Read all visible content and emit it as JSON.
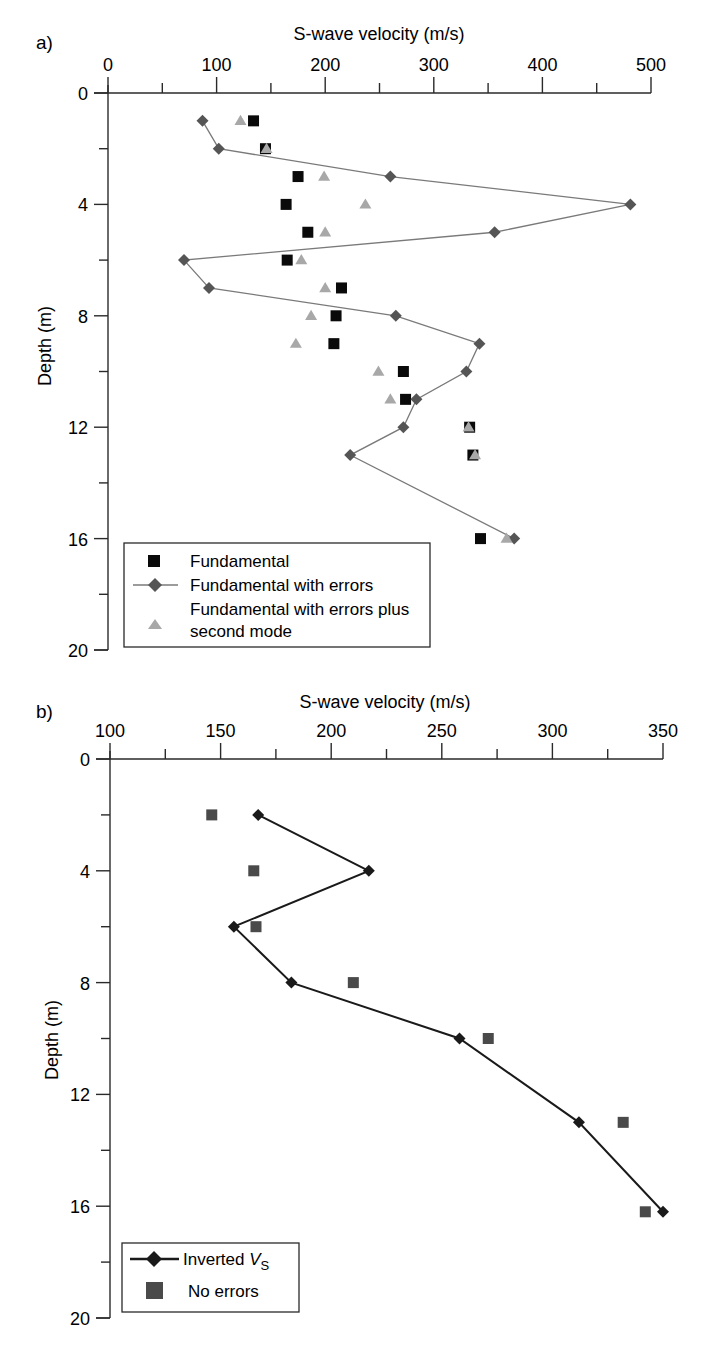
{
  "figure": {
    "panels": [
      {
        "id": "a",
        "label": "a)"
      },
      {
        "id": "b",
        "label": "b)"
      }
    ]
  },
  "colors": {
    "axis": "#2a2a2a",
    "fundamental_square": "#0a0a0a",
    "errors_diamond": "#555555",
    "errors_line": "#7a7a7a",
    "second_mode_triangle": "#a8a8a8",
    "inverted_line": "#1a1a1a",
    "no_errors_square": "#4a4a4a"
  },
  "chart_data": [
    {
      "panel": "a)",
      "type": "scatter",
      "title": "",
      "xlabel": "S-wave velocity (m/s)",
      "ylabel": "Depth (m)",
      "xlim": [
        0,
        500
      ],
      "ylim": [
        0,
        20
      ],
      "y_inverted": true,
      "x_axis_position": "top",
      "x_ticks": [
        0,
        100,
        200,
        300,
        400,
        500
      ],
      "x_minor_ticks": [
        50,
        150,
        250,
        350,
        450
      ],
      "y_ticks": [
        0,
        4,
        8,
        12,
        16,
        20
      ],
      "y_minor_ticks": [
        2,
        6,
        10,
        14,
        18
      ],
      "grid": false,
      "legend_position": "lower left",
      "series": [
        {
          "name": "Fundamental",
          "marker": "square",
          "line": false,
          "points": [
            {
              "depth": 1,
              "velocity": 134
            },
            {
              "depth": 2,
              "velocity": 145
            },
            {
              "depth": 3,
              "velocity": 175
            },
            {
              "depth": 4,
              "velocity": 164
            },
            {
              "depth": 5,
              "velocity": 184
            },
            {
              "depth": 6,
              "velocity": 165
            },
            {
              "depth": 7,
              "velocity": 215
            },
            {
              "depth": 8,
              "velocity": 210
            },
            {
              "depth": 9,
              "velocity": 208
            },
            {
              "depth": 10,
              "velocity": 272
            },
            {
              "depth": 11,
              "velocity": 274
            },
            {
              "depth": 12,
              "velocity": 333
            },
            {
              "depth": 13,
              "velocity": 336
            },
            {
              "depth": 16,
              "velocity": 343
            }
          ]
        },
        {
          "name": "Fundamental with errors",
          "marker": "diamond",
          "line": true,
          "points": [
            {
              "depth": 1,
              "velocity": 87
            },
            {
              "depth": 2,
              "velocity": 102
            },
            {
              "depth": 3,
              "velocity": 260
            },
            {
              "depth": 4,
              "velocity": 481
            },
            {
              "depth": 5,
              "velocity": 356
            },
            {
              "depth": 6,
              "velocity": 70
            },
            {
              "depth": 7,
              "velocity": 93
            },
            {
              "depth": 8,
              "velocity": 265
            },
            {
              "depth": 9,
              "velocity": 342
            },
            {
              "depth": 10,
              "velocity": 330
            },
            {
              "depth": 11,
              "velocity": 284
            },
            {
              "depth": 12,
              "velocity": 272
            },
            {
              "depth": 13,
              "velocity": 223
            },
            {
              "depth": 16,
              "velocity": 374
            }
          ]
        },
        {
          "name": "Fundamental with errors plus second mode",
          "marker": "triangle",
          "line": false,
          "points": [
            {
              "depth": 1,
              "velocity": 122
            },
            {
              "depth": 2,
              "velocity": 146
            },
            {
              "depth": 3,
              "velocity": 199
            },
            {
              "depth": 4,
              "velocity": 237
            },
            {
              "depth": 5,
              "velocity": 200
            },
            {
              "depth": 6,
              "velocity": 178
            },
            {
              "depth": 7,
              "velocity": 200
            },
            {
              "depth": 8,
              "velocity": 187
            },
            {
              "depth": 9,
              "velocity": 173
            },
            {
              "depth": 10,
              "velocity": 249
            },
            {
              "depth": 11,
              "velocity": 260
            },
            {
              "depth": 12,
              "velocity": 332
            },
            {
              "depth": 13,
              "velocity": 338
            },
            {
              "depth": 16,
              "velocity": 367
            }
          ]
        }
      ],
      "legend": [
        {
          "label": "Fundamental",
          "marker": "square"
        },
        {
          "label": "Fundamental with errors",
          "marker": "diamond-line"
        },
        {
          "label": "Fundamental with errors plus",
          "label2": "second mode",
          "marker": "triangle"
        }
      ]
    },
    {
      "panel": "b)",
      "type": "line",
      "title": "",
      "xlabel": "S-wave velocity (m/s)",
      "ylabel": "Depth (m)",
      "xlim": [
        100,
        350
      ],
      "ylim": [
        0,
        20
      ],
      "y_inverted": true,
      "x_axis_position": "top",
      "x_ticks": [
        100,
        150,
        200,
        250,
        300,
        350
      ],
      "x_minor_ticks": [
        125,
        175,
        225,
        275,
        325
      ],
      "y_ticks": [
        0,
        4,
        8,
        12,
        16,
        20
      ],
      "y_minor_ticks": [
        2,
        6,
        10,
        14,
        18
      ],
      "grid": false,
      "legend_position": "lower left",
      "series": [
        {
          "name": "Inverted VS",
          "marker": "diamond",
          "line": true,
          "points": [
            {
              "depth": 2,
              "velocity": 167
            },
            {
              "depth": 4,
              "velocity": 217
            },
            {
              "depth": 6,
              "velocity": 156
            },
            {
              "depth": 8,
              "velocity": 182
            },
            {
              "depth": 10,
              "velocity": 258
            },
            {
              "depth": 13,
              "velocity": 312
            },
            {
              "depth": 16.2,
              "velocity": 350
            }
          ]
        },
        {
          "name": "No errors",
          "marker": "square",
          "line": false,
          "points": [
            {
              "depth": 2,
              "velocity": 146
            },
            {
              "depth": 4,
              "velocity": 165
            },
            {
              "depth": 6,
              "velocity": 166
            },
            {
              "depth": 8,
              "velocity": 210
            },
            {
              "depth": 10,
              "velocity": 271
            },
            {
              "depth": 13,
              "velocity": 332
            },
            {
              "depth": 16.2,
              "velocity": 342
            }
          ]
        }
      ],
      "legend": [
        {
          "label": "Inverted ",
          "italic": "V",
          "sub": "S",
          "marker": "diamond-line"
        },
        {
          "label": "No errors",
          "marker": "square"
        }
      ]
    }
  ]
}
